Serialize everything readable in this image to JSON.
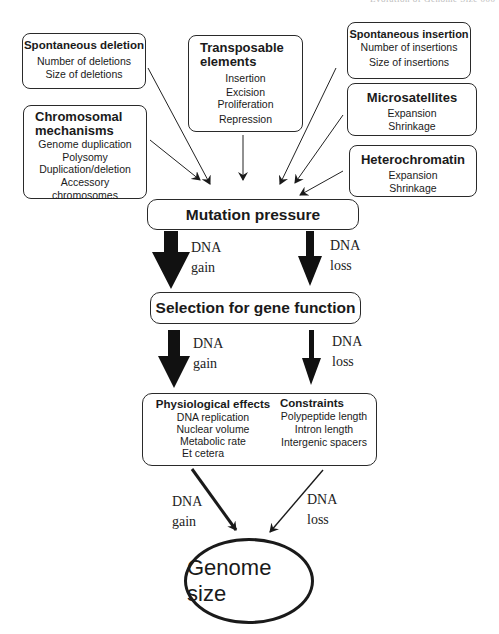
{
  "running_head": "Evolution of Genome Size   000",
  "sources": {
    "spontaneous_deletion": {
      "title": "Spontaneous deletion",
      "items": [
        "Number of deletions",
        "Size of deletions"
      ]
    },
    "chromosomal_mechanisms": {
      "title_line1": "Chromosomal",
      "title_line2": "mechanisms",
      "items": [
        "Genome duplication",
        "Polysomy",
        "Duplication/deletion",
        "Accessory",
        "chromosomes"
      ]
    },
    "transposable_elements": {
      "title_line1": "Transposable",
      "title_line2": "elements",
      "items": [
        "Insertion",
        "Excision",
        "Proliferation",
        "Repression"
      ]
    },
    "spontaneous_insertion": {
      "title": "Spontaneous insertion",
      "items": [
        "Number of insertions",
        "Size of insertions"
      ]
    },
    "microsatellites": {
      "title": "Microsatellites",
      "items": [
        "Expansion",
        "Shrinkage"
      ]
    },
    "heterochromatin": {
      "title": "Heterochromatin",
      "items": [
        "Expansion",
        "Shrinkage"
      ]
    }
  },
  "mutation_pressure": {
    "label": "Mutation pressure"
  },
  "selection": {
    "label": "Selection for gene function"
  },
  "effects_box": {
    "physiological": {
      "title": "Physiological effects",
      "items": [
        "DNA replication",
        "Nuclear volume",
        "Metabolic rate",
        "Et cetera"
      ]
    },
    "constraints": {
      "title": "Constraints",
      "items": [
        "Polypeptide length",
        "Intron length",
        "Intergenic spacers"
      ]
    }
  },
  "genome_size": {
    "label": "Genome size"
  },
  "arrow_labels": {
    "mp_gain": {
      "l1": "DNA",
      "l2": "gain"
    },
    "mp_loss": {
      "l1": "DNA",
      "l2": "loss"
    },
    "sel_gain": {
      "l1": "DNA",
      "l2": "gain"
    },
    "sel_loss": {
      "l1": "DNA",
      "l2": "loss"
    },
    "eff_gain": {
      "l1": "DNA",
      "l2": "gain"
    },
    "eff_loss": {
      "l1": "DNA",
      "l2": "loss"
    }
  }
}
